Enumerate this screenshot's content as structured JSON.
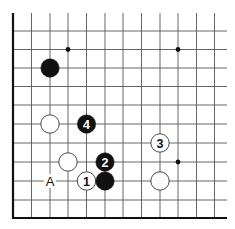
{
  "diagram": {
    "type": "go-board-fragment",
    "colors": {
      "background": "#ffffff",
      "grid_line": "#555555",
      "edge_line": "#111111",
      "black_stone": "#111111",
      "white_stone_fill": "#ffffff",
      "white_stone_stroke": "#333333"
    },
    "grid": {
      "x_lines": [
        13,
        31.5,
        50,
        68,
        86.5,
        105,
        123,
        141.5,
        160,
        178,
        196.5,
        214.5
      ],
      "y_lines": [
        31,
        49.5,
        68,
        86.5,
        105,
        124,
        143,
        162,
        181,
        200
      ],
      "top": 13,
      "right": 227,
      "bottom_edge_y": 218,
      "left_edge_x": 13
    },
    "star_points": [
      {
        "x": 68,
        "y": 49.5
      },
      {
        "x": 178,
        "y": 49.5
      },
      {
        "x": 178,
        "y": 162
      }
    ],
    "stones": [
      {
        "id": "black-unnumbered-top",
        "color": "black",
        "x": 50,
        "y": 68,
        "label": ""
      },
      {
        "id": "white-left",
        "color": "white",
        "x": 50,
        "y": 124,
        "label": ""
      },
      {
        "id": "black-4",
        "color": "black",
        "x": 86.5,
        "y": 124,
        "label": "4"
      },
      {
        "id": "white-center",
        "color": "white",
        "x": 68,
        "y": 162,
        "label": ""
      },
      {
        "id": "black-2",
        "color": "black",
        "x": 105,
        "y": 162,
        "label": "2"
      },
      {
        "id": "white-1",
        "color": "white",
        "x": 86.5,
        "y": 181,
        "label": "1"
      },
      {
        "id": "black-unnumbered-bottom",
        "color": "black",
        "x": 105,
        "y": 181,
        "label": ""
      },
      {
        "id": "white-3",
        "color": "white",
        "x": 160,
        "y": 143,
        "label": "3"
      },
      {
        "id": "white-right",
        "color": "white",
        "x": 160,
        "y": 181,
        "label": ""
      }
    ],
    "marks": [
      {
        "id": "point-a",
        "text": "A",
        "x": 50,
        "y": 181
      }
    ]
  }
}
